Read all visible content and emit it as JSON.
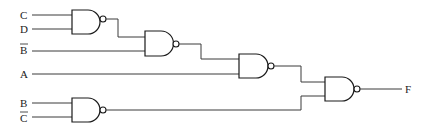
{
  "diagram": {
    "type": "logic-circuit",
    "gate_type": "NAND",
    "inputs": [
      {
        "id": "in_c",
        "label": "C",
        "negated": false
      },
      {
        "id": "in_d",
        "label": "D",
        "negated": false
      },
      {
        "id": "in_bbar",
        "label": "B",
        "negated": true
      },
      {
        "id": "in_a",
        "label": "A",
        "negated": false
      },
      {
        "id": "in_b",
        "label": "B",
        "negated": false
      },
      {
        "id": "in_cbar",
        "label": "C",
        "negated": true
      }
    ],
    "gates": [
      {
        "id": "g1",
        "type": "NAND",
        "inputs": [
          "C",
          "D"
        ]
      },
      {
        "id": "g2",
        "type": "NAND",
        "inputs": [
          "g1",
          "B̄"
        ]
      },
      {
        "id": "g3",
        "type": "NAND",
        "inputs": [
          "g2",
          "A"
        ]
      },
      {
        "id": "g5",
        "type": "NAND",
        "inputs": [
          "B",
          "C̄"
        ]
      },
      {
        "id": "g4",
        "type": "NAND",
        "inputs": [
          "g3",
          "g5"
        ],
        "output": "F"
      }
    ],
    "output": {
      "label": "F"
    }
  }
}
